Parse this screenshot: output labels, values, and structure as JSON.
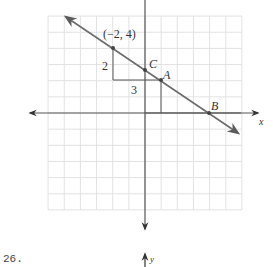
{
  "problem": {
    "number_label": "26."
  },
  "chart_data": {
    "type": "line",
    "title": "",
    "xlabel": "x",
    "ylabel": "y",
    "xlim": [
      -6,
      6
    ],
    "ylim": [
      -6,
      6
    ],
    "grid": true,
    "grid_step": 1,
    "line": {
      "through": [
        [
          -2,
          4
        ],
        [
          4,
          0
        ]
      ],
      "slope": -0.6667,
      "y_intercept": 2.6667,
      "arrows_both_ends": true
    },
    "points": [
      {
        "name": "(-2,4)",
        "label": "(−2, 4)",
        "x": -2,
        "y": 4
      },
      {
        "name": "C",
        "label": "C",
        "x": 0,
        "y": 2.6667
      },
      {
        "name": "A",
        "label": "A",
        "x": 1,
        "y": 2
      },
      {
        "name": "B",
        "label": "B",
        "x": 4,
        "y": 0
      }
    ],
    "slope_triangle": {
      "rise_label": "2",
      "run_label": "3",
      "vertices": [
        [
          -2,
          4
        ],
        [
          -2,
          2
        ],
        [
          1,
          2
        ]
      ]
    },
    "annotations": [
      {
        "text": "2",
        "role": "rise"
      },
      {
        "text": "3",
        "role": "run"
      }
    ]
  },
  "labels": {
    "point_minus2_4": "(−2, 4)",
    "point_c": "C",
    "point_a": "A",
    "point_b": "B",
    "rise": "2",
    "run": "3",
    "x_axis": "x",
    "y_axis": "y"
  },
  "colors": {
    "grid": "#e2e2e2",
    "axis": "#555555",
    "line": "#6b6b6b",
    "point": "#444444"
  }
}
